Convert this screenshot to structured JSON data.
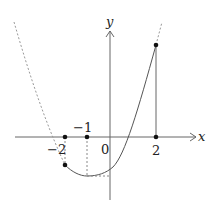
{
  "diagram": {
    "type": "function-graph",
    "axes": {
      "x_label": "x",
      "y_label": "y",
      "origin_label": "0"
    },
    "tick_labels": {
      "neg2": "−2",
      "neg1": "−1",
      "pos2": "2"
    },
    "marked_points": [
      {
        "x": -2,
        "note": "point on x-axis and on curve (dashed vertical)"
      },
      {
        "x": -1,
        "note": "minimum of curve (dashed vertical and horizontal)"
      },
      {
        "x": 2,
        "note": "point on x-axis and on curve (solid vertical)"
      }
    ],
    "curve": {
      "solid_domain": [
        -2,
        2
      ],
      "dashed_outside": true
    },
    "colors": {
      "line": "#555555",
      "dashed": "#888888",
      "point": "#111111"
    }
  }
}
